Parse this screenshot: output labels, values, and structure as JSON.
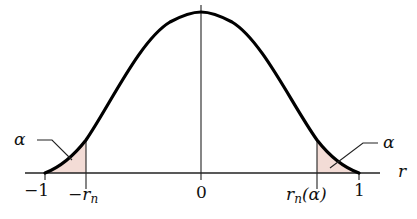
{
  "diagram": {
    "title": "",
    "axis": {
      "label": "r"
    },
    "ticks": [
      {
        "id": "minus-one",
        "label": "−1"
      },
      {
        "id": "minus-rn",
        "label": "−r",
        "sub": "n"
      },
      {
        "id": "zero",
        "label": "0"
      },
      {
        "id": "rn-alpha",
        "label": "r",
        "sub": "n",
        "suffix": "(α)"
      },
      {
        "id": "one",
        "label": "1"
      }
    ],
    "annotations": {
      "left_tail": "α",
      "right_tail": "α"
    },
    "colors": {
      "curve": "#000000",
      "shade": "#f3dcd6",
      "axis": "#222222"
    }
  }
}
